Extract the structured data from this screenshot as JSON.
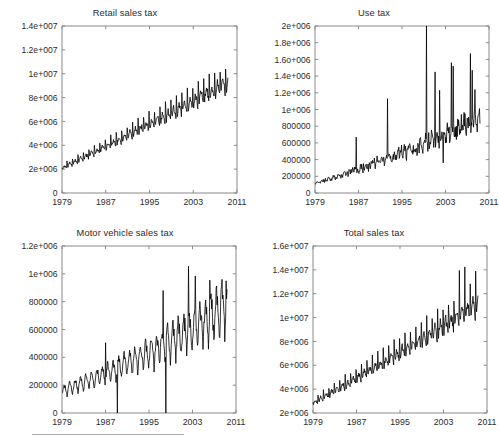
{
  "figure": {
    "background_color": "#ffffff",
    "axis_color": "#8a8a8a",
    "series_color": "#000000",
    "footer_rule_color": "#a7a7a7"
  },
  "chart_data": [
    {
      "id": "retail-sales-tax",
      "type": "line",
      "title": "Retail sales tax",
      "xlabel": "",
      "ylabel": "",
      "grid": false,
      "legend": false,
      "xlim": [
        1979,
        2011
      ],
      "ylim": [
        0,
        14000000
      ],
      "xticks": [
        1979,
        1987,
        1995,
        2003,
        2011
      ],
      "xtick_labels": [
        "1979",
        "1987",
        "1995",
        "2003",
        "2011"
      ],
      "yticks": [
        0,
        2000000,
        4000000,
        6000000,
        8000000,
        10000000,
        12000000,
        14000000
      ],
      "ytick_labels": [
        "0",
        "2e+006",
        "4e+006",
        "6e+006",
        "8e+006",
        "1e+007",
        "1.2e+007",
        "1.4e+007"
      ],
      "x_start": 1979.0,
      "x_end": 2009.4,
      "sampling": "monthly",
      "model": {
        "trend_start": 2050000,
        "trend_end": 9100000,
        "trend_curvature": 0.06,
        "season_amplitude_frac": 0.075,
        "december_spike_frac": 0.26,
        "noise_frac": 0.035,
        "seed": 1979
      },
      "notes": "Rising trend roughly 2e+006 in 1979 to about 9e+006 by 2009, with strong annual December spikes reaching 1.2e+007 near 2006-2008."
    },
    {
      "id": "use-tax",
      "type": "line",
      "title": "Use tax",
      "xlabel": "",
      "ylabel": "",
      "grid": false,
      "legend": false,
      "xlim": [
        1979,
        2011
      ],
      "ylim": [
        0,
        2000000
      ],
      "xticks": [
        1979,
        1987,
        1995,
        2003,
        2011
      ],
      "xtick_labels": [
        "1979",
        "1987",
        "1995",
        "2003",
        "2011"
      ],
      "yticks": [
        0,
        200000,
        400000,
        600000,
        800000,
        1000000,
        1200000,
        1400000,
        1600000,
        1800000,
        2000000
      ],
      "ytick_labels": [
        "0",
        "200000",
        "400000",
        "600000",
        "800000",
        "1e+006",
        "1.2e+006",
        "1.4e+006",
        "1.6o+006",
        "1.8e+006",
        "2e+006"
      ],
      "x_start": 1979.0,
      "x_end": 2009.4,
      "sampling": "monthly",
      "model": {
        "trend_start": 110000,
        "trend_end": 880000,
        "trend_curvature": 0.22,
        "season_amplitude_frac": 0.1,
        "december_spike_frac": 0.18,
        "noise_frac": 0.14,
        "seed": 7321,
        "random_spikes": [
          {
            "x": 1986.6,
            "value": 670000
          },
          {
            "x": 1992.3,
            "value": 1130000
          },
          {
            "x": 1999.5,
            "value": 2000000
          },
          {
            "x": 2001.1,
            "value": 1450000
          },
          {
            "x": 2001.9,
            "value": 1230000
          },
          {
            "x": 2004.1,
            "value": 1560000
          },
          {
            "x": 2004.4,
            "value": 1520000
          },
          {
            "x": 2007.6,
            "value": 1670000
          },
          {
            "x": 2007.9,
            "value": 1470000
          },
          {
            "x": 2008.4,
            "value": 1240000
          }
        ],
        "dips": [
          {
            "x": 2002.6,
            "value": 360000
          }
        ]
      },
      "notes": "Noisy rising series from about 1e+005 to roughly 9e+005 with irregular large spikes; the tallest reaches the 2e+006 axis top near 1999-2000."
    },
    {
      "id": "motor-vehicle-sales-tax",
      "type": "line",
      "title": "Motor vehicle sales tax",
      "xlabel": "",
      "ylabel": "",
      "grid": false,
      "legend": false,
      "xlim": [
        1979,
        2011
      ],
      "ylim": [
        0,
        1200000
      ],
      "xticks": [
        1979,
        1987,
        1995,
        2003,
        2011
      ],
      "xtick_labels": [
        "1979",
        "1987",
        "1995",
        "2003",
        "2011"
      ],
      "yticks": [
        0,
        200000,
        400000,
        600000,
        800000,
        1000000,
        1200000
      ],
      "ytick_labels": [
        "0",
        "200000",
        "400000",
        "600000",
        "800000",
        "1e+006",
        "1.2e+006"
      ],
      "x_start": 1979.1,
      "x_end": 2009.4,
      "sampling": "monthly",
      "model": {
        "trend_start": 165000,
        "trend_end": 790000,
        "trend_curvature": 0.3,
        "season_amplitude_frac": 0.2,
        "december_spike_frac": -0.1,
        "noise_frac": 0.07,
        "seed": 4412,
        "zero_gaps": [
          1989.2,
          1998.1
        ],
        "random_spikes": [
          {
            "x": 1987.0,
            "value": 505000
          },
          {
            "x": 1997.6,
            "value": 880000
          },
          {
            "x": 2002.3,
            "value": 1055000
          },
          {
            "x": 2003.5,
            "value": 985000
          },
          {
            "x": 2006.2,
            "value": 955000
          },
          {
            "x": 2009.2,
            "value": 950000
          }
        ]
      },
      "notes": "Strongly oscillating monthly series rising from about 1.6e+005 to roughly 8e+005, with two vertical drops to zero near 1989 and 1998 indicating missing values."
    },
    {
      "id": "total-sales-tax",
      "type": "line",
      "title": "Total sales tax",
      "xlabel": "",
      "ylabel": "",
      "grid": false,
      "legend": false,
      "xlim": [
        1979,
        2011
      ],
      "ylim": [
        2000000,
        16000000
      ],
      "xticks": [
        1979,
        1987,
        1995,
        2003,
        2011
      ],
      "xtick_labels": [
        "1979",
        "1987",
        "1995",
        "2003",
        "2011"
      ],
      "yticks": [
        2000000,
        4000000,
        6000000,
        8000000,
        10000000,
        12000000,
        14000000,
        16000000
      ],
      "ytick_labels": [
        "2e+006",
        "4e+006",
        "6e+006",
        "8e+006",
        "1e+007",
        "1.2e+007",
        "1.4e+007",
        "1.6e+007"
      ],
      "x_start": 1979.0,
      "x_end": 2009.4,
      "sampling": "monthly",
      "model": {
        "trend_start": 2750000,
        "trend_end": 10900000,
        "trend_curvature": 0.05,
        "season_amplitude_frac": 0.075,
        "december_spike_frac": 0.27,
        "noise_frac": 0.035,
        "seed": 8810,
        "random_spikes": [
          {
            "x": 2006.95,
            "value": 14250000
          },
          {
            "x": 2005.95,
            "value": 13950000
          },
          {
            "x": 2008.95,
            "value": 13900000
          }
        ]
      },
      "notes": "Sum of the three component taxes: trend from under 3e+006 to about 1.1e+007 with pronounced December spikes peaking near 1.43e+007 around 2006."
    }
  ]
}
